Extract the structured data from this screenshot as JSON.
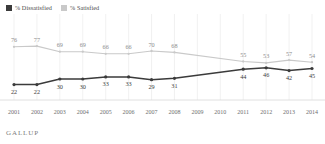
{
  "legend": {
    "items": [
      {
        "label": "% Dissatisfied",
        "color": "#3b3b3b",
        "icon": "square-swatch-icon"
      },
      {
        "label": "% Satisfied",
        "color": "#c9c9c9",
        "icon": "square-swatch-icon"
      }
    ]
  },
  "footer": {
    "brand": "GALLUP"
  },
  "chart_data": {
    "type": "line",
    "title": "",
    "subtitle": "",
    "xlabel": "",
    "ylabel": "",
    "ylim": [
      0,
      100
    ],
    "grid": "vertical",
    "legend_position": "top-left",
    "categories": [
      "2001",
      "2002",
      "2003",
      "2004",
      "2005",
      "2006",
      "2007",
      "2008",
      "2009",
      "2010",
      "2011",
      "2012",
      "2013",
      "2014"
    ],
    "series": [
      {
        "name": "% Satisfied",
        "color": "#c9c9c9",
        "values": [
          76,
          77,
          69,
          69,
          66,
          66,
          70,
          68,
          null,
          null,
          55,
          53,
          57,
          54
        ],
        "labels": [
          "76",
          "77",
          "69",
          "69",
          "66",
          "66",
          "70",
          "68",
          "",
          "",
          "55",
          "53",
          "57",
          "54"
        ]
      },
      {
        "name": "% Dissatisfied",
        "color": "#3b3b3b",
        "values": [
          22,
          22,
          30,
          30,
          33,
          33,
          29,
          31,
          null,
          null,
          44,
          46,
          42,
          45
        ],
        "labels": [
          "22",
          "22",
          "30",
          "30",
          "33",
          "33",
          "29",
          "31",
          "",
          "",
          "44",
          "46",
          "42",
          "45"
        ]
      }
    ],
    "tick_labels": [
      "2001",
      "2002",
      "2003",
      "2004",
      "2005",
      "2006",
      "2007",
      "2008",
      "2009",
      "2010",
      "2011",
      "2012",
      "2013",
      "2014"
    ]
  }
}
